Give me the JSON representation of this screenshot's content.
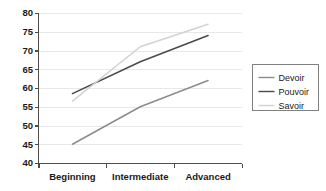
{
  "chart_data": {
    "type": "line",
    "title": "",
    "subtitle": "",
    "xlabel": "",
    "ylabel": "",
    "categories": [
      "Beginning",
      "Intermediate",
      "Advanced"
    ],
    "ylim": [
      40,
      80
    ],
    "yticks": [
      40,
      45,
      50,
      55,
      60,
      65,
      70,
      75,
      80
    ],
    "ytick_labels": [
      "40",
      "45",
      "50",
      "55",
      "60",
      "65",
      "70",
      "75",
      "80"
    ],
    "grid": true,
    "legend_position": "right",
    "series": [
      {
        "name": "Devoir",
        "values": [
          45.0,
          55.0,
          62.0
        ],
        "color": "#8c8c8c"
      },
      {
        "name": "Pouvoir",
        "values": [
          58.5,
          67.0,
          74.0
        ],
        "color": "#4a4a4a"
      },
      {
        "name": "Savoir",
        "values": [
          56.5,
          71.0,
          77.0
        ],
        "color": "#d2d2d2"
      }
    ]
  },
  "axes": {
    "y_ticks": [
      "80",
      "75",
      "70",
      "65",
      "60",
      "55",
      "50",
      "45",
      "40"
    ],
    "x_categories": [
      "Beginning",
      "Intermediate",
      "Advanced"
    ]
  },
  "legend": {
    "items": [
      {
        "label": "Devoir"
      },
      {
        "label": "Pouvoir"
      },
      {
        "label": "Savoir"
      }
    ]
  },
  "colors": {
    "devoir": "#8c8c8c",
    "pouvoir": "#4a4a4a",
    "savoir": "#d2d2d2",
    "axis": "#4d4d4d",
    "grid": "#e8e8e8",
    "legend_border": "#808080",
    "background": "#ffffff"
  }
}
